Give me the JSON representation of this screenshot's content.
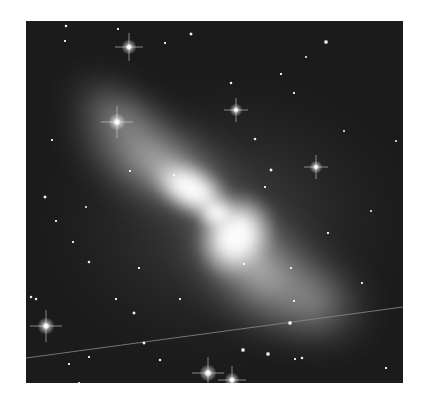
{
  "image": {
    "subject": "bipolar reflection nebula with surrounding star field (grayscale)",
    "background_color": "#1b1b1b",
    "nebula": {
      "center": [
        190,
        192
      ],
      "core_color": "#ffffff",
      "lobe_color": "#cfcfcf"
    },
    "stars": [
      {
        "x": 103,
        "y": 26,
        "r": 3.5,
        "spikes": true
      },
      {
        "x": 91,
        "y": 101,
        "r": 4,
        "spikes": true
      },
      {
        "x": 210,
        "y": 89,
        "r": 3,
        "spikes": true
      },
      {
        "x": 290,
        "y": 146,
        "r": 3,
        "spikes": true
      },
      {
        "x": 20,
        "y": 305,
        "r": 4,
        "spikes": true
      },
      {
        "x": 182,
        "y": 352,
        "r": 4,
        "spikes": true
      },
      {
        "x": 206,
        "y": 359,
        "r": 3.5,
        "spikes": true
      },
      {
        "x": 300,
        "y": 21,
        "r": 2.5,
        "spikes": false
      },
      {
        "x": 165,
        "y": 13,
        "r": 2,
        "spikes": false
      },
      {
        "x": 40,
        "y": 5,
        "r": 1.8,
        "spikes": false
      },
      {
        "x": 92,
        "y": 8,
        "r": 1.5,
        "spikes": false
      },
      {
        "x": 39,
        "y": 20,
        "r": 1.5,
        "spikes": false
      },
      {
        "x": 139,
        "y": 22,
        "r": 1.5,
        "spikes": false
      },
      {
        "x": 255,
        "y": 53,
        "r": 1.6,
        "spikes": false
      },
      {
        "x": 268,
        "y": 72,
        "r": 1.5,
        "spikes": false
      },
      {
        "x": 205,
        "y": 62,
        "r": 1.8,
        "spikes": false
      },
      {
        "x": 26,
        "y": 119,
        "r": 1.5,
        "spikes": false
      },
      {
        "x": 229,
        "y": 118,
        "r": 1.8,
        "spikes": false
      },
      {
        "x": 245,
        "y": 149,
        "r": 2,
        "spikes": false
      },
      {
        "x": 19,
        "y": 176,
        "r": 2,
        "spikes": false
      },
      {
        "x": 30,
        "y": 200,
        "r": 1.5,
        "spikes": false
      },
      {
        "x": 104,
        "y": 150,
        "r": 1.5,
        "spikes": false
      },
      {
        "x": 148,
        "y": 154,
        "r": 1.5,
        "spikes": false
      },
      {
        "x": 47,
        "y": 221,
        "r": 1.5,
        "spikes": false
      },
      {
        "x": 63,
        "y": 241,
        "r": 1.8,
        "spikes": false
      },
      {
        "x": 113,
        "y": 247,
        "r": 1.6,
        "spikes": false
      },
      {
        "x": 90,
        "y": 278,
        "r": 1.6,
        "spikes": false
      },
      {
        "x": 108,
        "y": 292,
        "r": 2,
        "spikes": false
      },
      {
        "x": 154,
        "y": 278,
        "r": 1.5,
        "spikes": false
      },
      {
        "x": 239,
        "y": 166,
        "r": 1.5,
        "spikes": false
      },
      {
        "x": 265,
        "y": 247,
        "r": 1.5,
        "spikes": false
      },
      {
        "x": 302,
        "y": 212,
        "r": 1.6,
        "spikes": false
      },
      {
        "x": 218,
        "y": 243,
        "r": 1.5,
        "spikes": false
      },
      {
        "x": 63,
        "y": 336,
        "r": 1.5,
        "spikes": false
      },
      {
        "x": 53,
        "y": 362,
        "r": 1.5,
        "spikes": false
      },
      {
        "x": 43,
        "y": 343,
        "r": 1.5,
        "spikes": false
      },
      {
        "x": 134,
        "y": 339,
        "r": 1.8,
        "spikes": false
      },
      {
        "x": 118,
        "y": 322,
        "r": 2,
        "spikes": false
      },
      {
        "x": 217,
        "y": 329,
        "r": 2.5,
        "spikes": false
      },
      {
        "x": 242,
        "y": 333,
        "r": 2.5,
        "spikes": false
      },
      {
        "x": 276,
        "y": 337,
        "r": 1.8,
        "spikes": false
      },
      {
        "x": 264,
        "y": 302,
        "r": 2.5,
        "spikes": false
      },
      {
        "x": 268,
        "y": 280,
        "r": 1.5,
        "spikes": false
      },
      {
        "x": 269,
        "y": 338,
        "r": 1.5,
        "spikes": false
      },
      {
        "x": 360,
        "y": 347,
        "r": 1.6,
        "spikes": false
      },
      {
        "x": 336,
        "y": 262,
        "r": 1.5,
        "spikes": false
      },
      {
        "x": 370,
        "y": 120,
        "r": 1.3,
        "spikes": false
      },
      {
        "x": 345,
        "y": 190,
        "r": 1.3,
        "spikes": false
      },
      {
        "x": 10,
        "y": 278,
        "r": 1.8,
        "spikes": false
      },
      {
        "x": 5,
        "y": 276,
        "r": 1.8,
        "spikes": false
      },
      {
        "x": 60,
        "y": 186,
        "r": 1.3,
        "spikes": false
      },
      {
        "x": 280,
        "y": 36,
        "r": 1.3,
        "spikes": false
      },
      {
        "x": 318,
        "y": 110,
        "r": 1.3,
        "spikes": false
      }
    ],
    "satellite_trail": {
      "x1": 0,
      "y1": 337,
      "x2": 377,
      "y2": 286
    }
  }
}
